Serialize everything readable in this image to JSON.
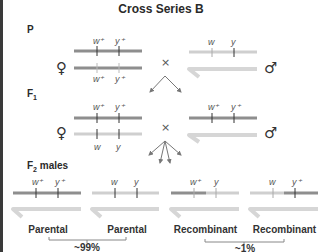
{
  "title": "Cross Series B",
  "generations": {
    "p": {
      "label": "P"
    },
    "f1": {
      "label": "F",
      "sub": "1"
    },
    "f2": {
      "label": "F",
      "sub": "2",
      "suffix": " males"
    }
  },
  "colors": {
    "wild_type": "#8e8e8e",
    "mutant": "#cfcfcf",
    "y_chromosome": "#d6d6d6",
    "tick": "#333333",
    "arrow": "#777777",
    "border": "#3a3a3a"
  },
  "p_cross": {
    "female": {
      "symbol": "♀",
      "top": [
        "w⁺",
        "y⁺"
      ],
      "bottom": [
        "w⁺",
        "y⁺"
      ]
    },
    "male": {
      "symbol": "♂",
      "x": [
        "w",
        "y"
      ]
    },
    "cross_symbol": "×"
  },
  "f1_cross": {
    "female": {
      "symbol": "♀",
      "top": [
        "w⁺",
        "y⁺"
      ],
      "bottom": [
        "w",
        "y"
      ]
    },
    "male": {
      "symbol": "♂",
      "x": [
        "w⁺",
        "y⁺"
      ]
    },
    "cross_symbol": "×"
  },
  "f2_males": [
    {
      "alleles": [
        "w⁺",
        "y⁺"
      ],
      "type": "Parental"
    },
    {
      "alleles": [
        "w",
        "y"
      ],
      "type": "Parental"
    },
    {
      "alleles": [
        "w⁺",
        "y"
      ],
      "type": "Recombinant"
    },
    {
      "alleles": [
        "w",
        "y⁺"
      ],
      "type": "Recombinant"
    }
  ],
  "frequencies": {
    "parental": "~99%",
    "recombinant": "~1%"
  }
}
